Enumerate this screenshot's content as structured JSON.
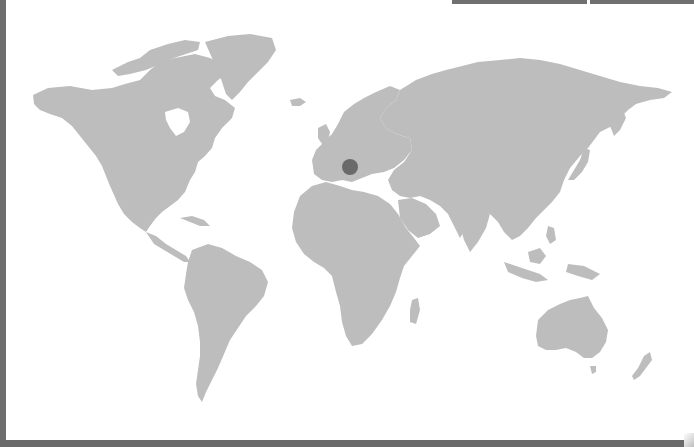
{
  "map": {
    "type": "world-map",
    "land_color": "#bdbdbd",
    "water_color": "#ffffff",
    "frame_color": "#6e6e6e",
    "marker": {
      "region": "Central Europe (Alps / Northern Italy)",
      "x": 350,
      "y": 167,
      "radius": 8,
      "color": "#6a6a6a"
    }
  }
}
